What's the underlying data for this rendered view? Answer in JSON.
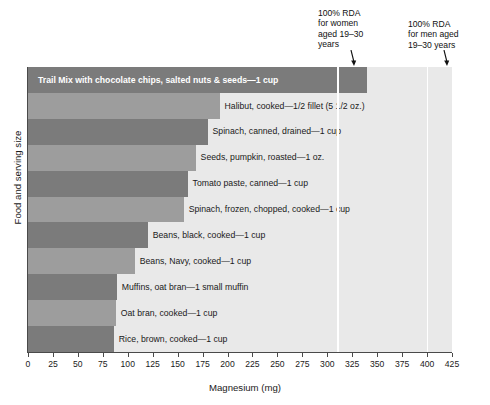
{
  "chart_data": {
    "type": "bar",
    "orientation": "horizontal",
    "title": "",
    "xlabel": "Magnesium (mg)",
    "ylabel": "Food and serving size",
    "xlim": [
      0,
      425
    ],
    "xticks": [
      0,
      25,
      50,
      75,
      100,
      125,
      150,
      175,
      200,
      225,
      250,
      275,
      300,
      325,
      350,
      375,
      400,
      425
    ],
    "grid": false,
    "legend": "none",
    "categories": [
      "Trail Mix with chocolate chips, salted nuts & seeds—1 cup",
      "Halibut, cooked—1/2 fillet (5 1/2 oz.)",
      "Spinach, canned, drained—1 cup",
      "Seeds, pumpkin, roasted—1 oz.",
      "Tomato paste, canned—1 cup",
      "Spinach, frozen, chopped, cooked—1 cup",
      "Beans, black, cooked—1 cup",
      "Beans, Navy, cooked—1 cup",
      "Muffins, oat bran—1 small muffin",
      "Oat bran, cooked—1 cup",
      "Rice, brown, cooked—1 cup"
    ],
    "values": [
      340,
      192,
      180,
      168,
      160,
      156,
      120,
      107,
      89,
      88,
      86
    ],
    "bar_colors": [
      "#7b7b7b",
      "#9d9d9d",
      "#7b7b7b",
      "#9d9d9d",
      "#7b7b7b",
      "#9d9d9d",
      "#7b7b7b",
      "#9d9d9d",
      "#7b7b7b",
      "#9d9d9d",
      "#7b7b7b"
    ],
    "label_inside": [
      true,
      false,
      false,
      false,
      false,
      false,
      false,
      false,
      false,
      false,
      false
    ],
    "annotations": [
      {
        "text": "100% RDA\nfor women\naged 19–30\nyears",
        "value": 310
      },
      {
        "text": "100% RDA\nfor men aged\n19–30 years",
        "value": 400
      }
    ],
    "reference_lines": [
      310,
      400
    ],
    "plot_background": "#e9e9e9",
    "reference_line_color": "#ffffff",
    "axis_color": "#4a4a4a"
  }
}
